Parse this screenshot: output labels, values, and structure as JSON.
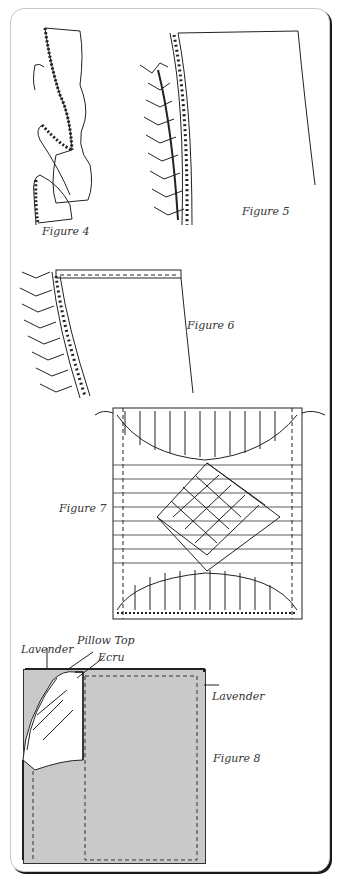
{
  "figures": {
    "fig4": {
      "label": "Figure 4"
    },
    "fig5": {
      "label": "Figure 5"
    },
    "fig6": {
      "label": "Figure 6"
    },
    "fig7": {
      "label": "Figure 7"
    },
    "fig8": {
      "label": "Figure 8",
      "callouts": {
        "lavender_top": "Lavender",
        "pillow_top": "Pillow Top",
        "ecru": "Ecru",
        "lavender_right": "Lavender"
      }
    }
  },
  "colors": {
    "frame_border": "#c8c8c8",
    "frame_shadow": "#1a1a1a",
    "lavender_fill": "#c9c9c9",
    "ink": "#222222"
  }
}
